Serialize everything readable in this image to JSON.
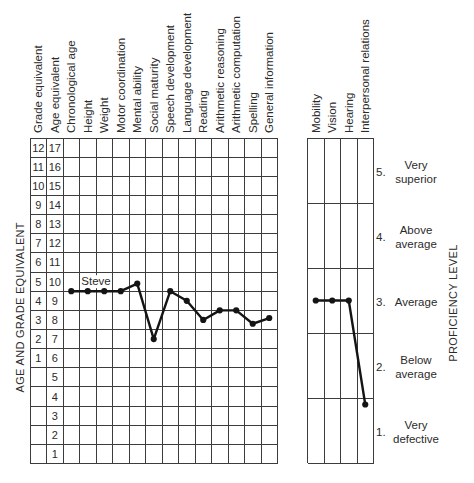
{
  "chart_data": [
    {
      "type": "line",
      "title": "",
      "axis_columns": [
        "Grade equivalent",
        "Age equivalent"
      ],
      "categories": [
        "Chronological age",
        "Height",
        "Weight",
        "Motor coordination",
        "Mental ability",
        "Social maturity",
        "Speech development",
        "Language development",
        "Reading",
        "Arithmetic reasoning",
        "Arithmetic computation",
        "Spelling",
        "General information"
      ],
      "series": [
        {
          "name": "Steve",
          "values": [
            9.5,
            9.5,
            9.5,
            9.5,
            9.9,
            7.0,
            9.5,
            9.0,
            8.0,
            8.5,
            8.5,
            7.8,
            8.1
          ]
        }
      ],
      "grade_ticks": [
        "12",
        "11",
        "10",
        "9",
        "8",
        "7",
        "6",
        "5",
        "4",
        "3",
        "2",
        "1"
      ],
      "age_ticks": [
        "17",
        "16",
        "15",
        "14",
        "13",
        "12",
        "11",
        "10",
        "9",
        "8",
        "7",
        "6",
        "5",
        "4",
        "3",
        "2",
        "1"
      ],
      "xlabel": "",
      "ylabel": "AGE AND GRADE EQUIVALENT",
      "ylim": [
        1,
        17
      ],
      "y_units": "age equivalent (years)",
      "grid": true
    },
    {
      "type": "line",
      "title": "",
      "categories": [
        "Mobility",
        "Vision",
        "Hearing",
        "Interpersonal relations"
      ],
      "series": [
        {
          "name": "Steve",
          "values": [
            3,
            3,
            3,
            1.4
          ]
        }
      ],
      "levels": [
        {
          "number": "5.",
          "label": [
            "Very",
            "superior"
          ]
        },
        {
          "number": "4.",
          "label": [
            "Above",
            "average"
          ]
        },
        {
          "number": "3.",
          "label": [
            "Average"
          ]
        },
        {
          "number": "2.",
          "label": [
            "Below",
            "average"
          ]
        },
        {
          "number": "1.",
          "label": [
            "Very",
            "defective"
          ]
        }
      ],
      "xlabel": "",
      "ylabel": "PROFICIENCY LEVEL",
      "ylim": [
        1,
        5
      ],
      "grid": true
    }
  ]
}
